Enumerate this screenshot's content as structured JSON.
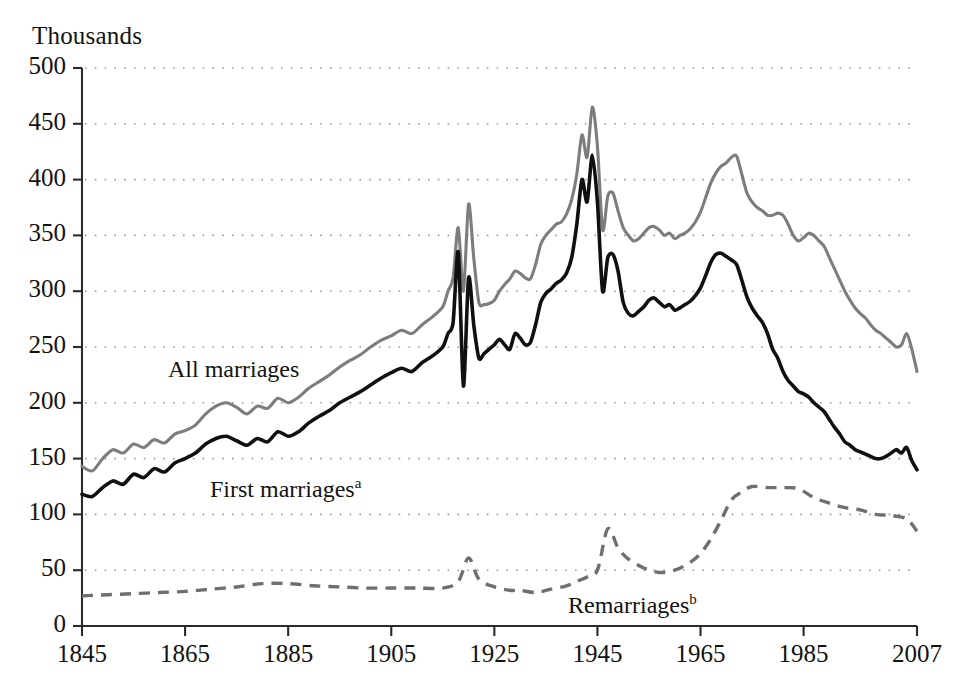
{
  "chart_data": {
    "type": "line",
    "title": "",
    "subtitle": "",
    "ylabel": "Thousands",
    "xlabel": "",
    "xlim": [
      1845,
      2007
    ],
    "ylim": [
      0,
      500
    ],
    "grid": "horizontal-dotted",
    "legend": "inline-annotations",
    "y_ticks": [
      0,
      50,
      100,
      150,
      200,
      250,
      300,
      350,
      400,
      450,
      500
    ],
    "y_tick_labels": [
      "0",
      "50",
      "100",
      "150",
      "200",
      "250",
      "300",
      "350",
      "400",
      "450",
      "500"
    ],
    "x_ticks": [
      1845,
      1865,
      1885,
      1905,
      1925,
      1945,
      1965,
      1985,
      2007
    ],
    "x_tick_labels": [
      "1845",
      "1865",
      "1885",
      "1905",
      "1925",
      "1945",
      "1965",
      "1985",
      "2007"
    ],
    "annotations": [
      {
        "id": "all-marriages",
        "text": "All marriages",
        "sup": "",
        "x_px": 168,
        "y_px": 356
      },
      {
        "id": "first-marriages",
        "text": "First marriages",
        "sup": "a",
        "x_px": 210,
        "y_px": 475
      },
      {
        "id": "remarriages",
        "text": "Remarriages",
        "sup": "b",
        "x_px": 568,
        "y_px": 591
      }
    ],
    "colors": {
      "all_marriages": "#7d7d7d",
      "first_marriages": "#101010",
      "remarriages": "#6f6f6f",
      "axis": "#2a2a2a",
      "grid": "#9a9a9a",
      "background": "#ffffff"
    },
    "series": [
      {
        "name": "All marriages",
        "style": "solid-gray",
        "x": [
          1845,
          1847,
          1849,
          1851,
          1853,
          1855,
          1857,
          1859,
          1861,
          1863,
          1865,
          1867,
          1869,
          1871,
          1873,
          1875,
          1877,
          1879,
          1881,
          1883,
          1885,
          1887,
          1889,
          1891,
          1893,
          1895,
          1897,
          1899,
          1901,
          1903,
          1905,
          1907,
          1909,
          1911,
          1913,
          1915,
          1916,
          1917,
          1918,
          1919,
          1920,
          1921,
          1922,
          1923,
          1924,
          1925,
          1926,
          1927,
          1928,
          1929,
          1930,
          1931,
          1932,
          1933,
          1934,
          1935,
          1936,
          1937,
          1938,
          1939,
          1940,
          1941,
          1942,
          1943,
          1944,
          1945,
          1946,
          1947,
          1948,
          1949,
          1950,
          1951,
          1952,
          1953,
          1954,
          1955,
          1956,
          1957,
          1958,
          1959,
          1960,
          1961,
          1962,
          1963,
          1964,
          1965,
          1966,
          1967,
          1968,
          1969,
          1970,
          1971,
          1972,
          1973,
          1974,
          1975,
          1976,
          1977,
          1978,
          1979,
          1980,
          1981,
          1982,
          1983,
          1984,
          1985,
          1986,
          1987,
          1988,
          1989,
          1990,
          1991,
          1992,
          1993,
          1994,
          1995,
          1996,
          1997,
          1998,
          1999,
          2000,
          2001,
          2002,
          2003,
          2004,
          2005,
          2006,
          2007
        ],
        "y": [
          143,
          139,
          150,
          158,
          155,
          163,
          160,
          167,
          164,
          172,
          175,
          180,
          190,
          197,
          200,
          196,
          190,
          197,
          195,
          204,
          200,
          205,
          213,
          219,
          225,
          232,
          238,
          243,
          250,
          256,
          260,
          265,
          262,
          270,
          277,
          286,
          300,
          312,
          357,
          300,
          378,
          330,
          290,
          288,
          289,
          292,
          300,
          306,
          311,
          318,
          316,
          312,
          311,
          324,
          342,
          350,
          355,
          360,
          362,
          369,
          382,
          405,
          440,
          420,
          465,
          430,
          355,
          385,
          388,
          372,
          357,
          350,
          345,
          347,
          352,
          357,
          358,
          355,
          350,
          352,
          347,
          350,
          352,
          356,
          362,
          371,
          384,
          397,
          406,
          412,
          415,
          420,
          421,
          405,
          388,
          380,
          375,
          372,
          368,
          368,
          370,
          368,
          360,
          350,
          345,
          348,
          352,
          350,
          345,
          340,
          330,
          320,
          310,
          300,
          292,
          285,
          280,
          276,
          270,
          265,
          262,
          258,
          254,
          250,
          252,
          262,
          248,
          228
        ]
      },
      {
        "name": "First marriages",
        "style": "solid-black",
        "x": [
          1845,
          1847,
          1849,
          1851,
          1853,
          1855,
          1857,
          1859,
          1861,
          1863,
          1865,
          1867,
          1869,
          1871,
          1873,
          1875,
          1877,
          1879,
          1881,
          1883,
          1885,
          1887,
          1889,
          1891,
          1893,
          1895,
          1897,
          1899,
          1901,
          1903,
          1905,
          1907,
          1909,
          1911,
          1913,
          1915,
          1916,
          1917,
          1918,
          1919,
          1920,
          1921,
          1922,
          1923,
          1924,
          1925,
          1926,
          1927,
          1928,
          1929,
          1930,
          1931,
          1932,
          1933,
          1934,
          1935,
          1936,
          1937,
          1938,
          1939,
          1940,
          1941,
          1942,
          1943,
          1944,
          1945,
          1946,
          1947,
          1948,
          1949,
          1950,
          1951,
          1952,
          1953,
          1954,
          1955,
          1956,
          1957,
          1958,
          1959,
          1960,
          1961,
          1962,
          1963,
          1964,
          1965,
          1966,
          1967,
          1968,
          1969,
          1970,
          1971,
          1972,
          1973,
          1974,
          1975,
          1976,
          1977,
          1978,
          1979,
          1980,
          1981,
          1982,
          1983,
          1984,
          1985,
          1986,
          1987,
          1988,
          1989,
          1990,
          1991,
          1992,
          1993,
          1994,
          1995,
          1996,
          1997,
          1998,
          1999,
          2000,
          2001,
          2002,
          2003,
          2004,
          2005,
          2006,
          2007
        ],
        "y": [
          118,
          116,
          124,
          130,
          127,
          136,
          133,
          141,
          138,
          146,
          150,
          155,
          163,
          168,
          170,
          166,
          162,
          168,
          165,
          174,
          170,
          174,
          182,
          188,
          193,
          200,
          205,
          210,
          216,
          222,
          227,
          231,
          228,
          236,
          242,
          250,
          262,
          272,
          335,
          215,
          312,
          270,
          240,
          244,
          248,
          252,
          257,
          252,
          248,
          262,
          258,
          252,
          254,
          270,
          290,
          298,
          302,
          307,
          310,
          316,
          330,
          360,
          400,
          380,
          422,
          380,
          300,
          330,
          333,
          318,
          290,
          280,
          278,
          282,
          286,
          292,
          294,
          290,
          286,
          288,
          283,
          285,
          288,
          291,
          296,
          303,
          314,
          326,
          333,
          334,
          331,
          328,
          324,
          310,
          295,
          285,
          278,
          272,
          262,
          248,
          240,
          228,
          220,
          215,
          210,
          208,
          205,
          200,
          196,
          192,
          185,
          178,
          172,
          165,
          162,
          158,
          156,
          154,
          152,
          150,
          150,
          152,
          155,
          158,
          155,
          160,
          148,
          140
        ]
      },
      {
        "name": "Remarriages",
        "style": "dashed-gray",
        "x": [
          1845,
          1850,
          1855,
          1860,
          1865,
          1870,
          1875,
          1880,
          1885,
          1890,
          1895,
          1900,
          1905,
          1910,
          1915,
          1918,
          1920,
          1922,
          1925,
          1928,
          1930,
          1933,
          1936,
          1939,
          1941,
          1943,
          1945,
          1947,
          1949,
          1951,
          1954,
          1957,
          1960,
          1963,
          1965,
          1967,
          1969,
          1971,
          1973,
          1975,
          1978,
          1981,
          1984,
          1987,
          1990,
          1993,
          1996,
          1999,
          2002,
          2005,
          2007
        ],
        "y": [
          27,
          28,
          29,
          30,
          31,
          33,
          35,
          38,
          38,
          36,
          35,
          34,
          34,
          34,
          34,
          40,
          61,
          42,
          35,
          32,
          32,
          30,
          33,
          36,
          40,
          44,
          50,
          87,
          70,
          60,
          52,
          48,
          50,
          57,
          65,
          78,
          95,
          113,
          120,
          125,
          124,
          124,
          123,
          115,
          110,
          106,
          104,
          100,
          99,
          96,
          85
        ]
      }
    ]
  },
  "plot_geometry": {
    "left_px": 82,
    "right_px": 917,
    "top_px": 68,
    "bottom_px": 626
  }
}
